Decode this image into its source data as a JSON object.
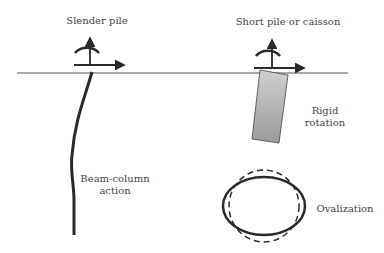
{
  "labels": {
    "slender_pile": "Slender pile",
    "short_pile": "Short pile or caisson",
    "rigid_line1": "Rigid",
    "rigid_line2": "rotation",
    "beam_line1": "Beam-column",
    "beam_line2": "action",
    "ovalization": "Ovalization"
  },
  "colors": {
    "stroke": "#2a2a2a",
    "ground": "#555555",
    "caisson_fill_top": "#cccccc",
    "caisson_fill_bottom": "#999999",
    "text": "#444444"
  }
}
